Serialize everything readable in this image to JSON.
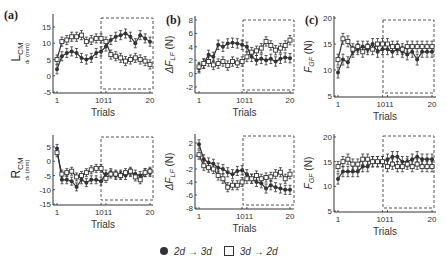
{
  "legend": {
    "filled_label": "2d → 3d",
    "open_label": "3d → 2d"
  },
  "row_labels": {
    "top": "L",
    "top_sub": "CM",
    "bottom": "R",
    "bottom_sub": "CM"
  },
  "panel_labels": {
    "a": "(a)",
    "b": "(b)",
    "c": "(c)"
  },
  "colors": {
    "line": "#333333",
    "dashed_box": "#555555",
    "filled_marker": "#333333",
    "open_marker": "#ffffff"
  },
  "chart_data": [
    {
      "id": "a-top",
      "type": "line",
      "panel": "(a)",
      "row": "LCM",
      "xlabel": "Trials",
      "ylabel": "d_t (mm)",
      "xticks": [
        "1",
        "10",
        "11",
        "20"
      ],
      "yticks": [
        15,
        10,
        5,
        0,
        -5
      ],
      "ylim": [
        -5,
        17
      ],
      "highlight_box": {
        "x_from": 11,
        "x_to": 20
      },
      "series": [
        {
          "name": "2d → 3d",
          "marker": "filled-circle",
          "values": [
            2,
            6,
            7,
            7.5,
            7,
            5.5,
            5,
            5.5,
            7,
            7.5,
            9,
            11,
            12,
            12.5,
            13,
            12,
            10,
            12.5,
            11.5,
            10.5
          ]
        },
        {
          "name": "3d → 2d",
          "marker": "open-square",
          "values": [
            5,
            10.5,
            11,
            12,
            12,
            12.5,
            10.5,
            11,
            11.5,
            11.5,
            10.5,
            6.5,
            6,
            5.5,
            4.5,
            5,
            5.5,
            5,
            4.5,
            3.5
          ]
        }
      ]
    },
    {
      "id": "b-top",
      "type": "line",
      "panel": "(b)",
      "row": "LCM",
      "xlabel": "Trials",
      "ylabel": "ΔF_LF (N)",
      "xticks": [
        "1",
        "10",
        "11",
        "20"
      ],
      "yticks": [
        8,
        6,
        4,
        2,
        0,
        -2
      ],
      "ylim": [
        -2.5,
        8
      ],
      "highlight_box": {
        "x_from": 11,
        "x_to": 20
      },
      "series": [
        {
          "name": "2d → 3d",
          "marker": "filled-circle",
          "values": [
            0.8,
            1.5,
            2.8,
            2.5,
            4.3,
            4.0,
            4.5,
            4.6,
            4.5,
            4.3,
            4.0,
            2.5,
            2.0,
            2.2,
            2.0,
            2.2,
            1.8,
            2.2,
            2.4,
            2.3
          ]
        },
        {
          "name": "3d → 2d",
          "marker": "open-square",
          "values": [
            1.0,
            1.5,
            1.8,
            1.3,
            1.5,
            1.8,
            1.2,
            1.8,
            1.6,
            1.8,
            2.5,
            3.2,
            3.4,
            3.8,
            4.8,
            4.2,
            3.5,
            3.8,
            4.2,
            5.0
          ]
        }
      ]
    },
    {
      "id": "c-top",
      "type": "line",
      "panel": "(c)",
      "row": "LCM",
      "xlabel": "Trials",
      "ylabel": "F_GF (N)",
      "xticks": [
        "1",
        "10",
        "11",
        "20"
      ],
      "yticks": [
        20,
        15,
        10,
        5
      ],
      "ylim": [
        5,
        20
      ],
      "highlight_box": {
        "x_from": 11,
        "x_to": 20
      },
      "series": [
        {
          "name": "2d → 3d",
          "marker": "filled-circle",
          "values": [
            9.5,
            12,
            11.5,
            13.5,
            14,
            14.5,
            14,
            15,
            13.5,
            14,
            14,
            13.5,
            14,
            13.5,
            13,
            13.5,
            12,
            13.5,
            13.5,
            13.5
          ]
        },
        {
          "name": "3d → 2d",
          "marker": "open-square",
          "values": [
            12,
            16,
            15.5,
            14,
            14.5,
            13.5,
            14.5,
            14,
            15,
            15,
            15,
            14.5,
            14.5,
            14,
            14.5,
            14.5,
            14.5,
            14.5,
            14.5,
            14.5
          ]
        }
      ]
    },
    {
      "id": "a-bottom",
      "type": "line",
      "panel": "(a)",
      "row": "RCM",
      "xlabel": "Trials",
      "ylabel": "d_t (mm)",
      "xticks": [
        "1",
        "10",
        "11",
        "20"
      ],
      "yticks": [
        5,
        0,
        -5,
        -10,
        -15
      ],
      "ylim": [
        -15,
        7
      ],
      "highlight_box": {
        "x_from": 11,
        "x_to": 20
      },
      "series": [
        {
          "name": "2d → 3d",
          "marker": "filled-circle",
          "values": [
            4.5,
            -6.5,
            -6.5,
            -7,
            -9,
            -6.5,
            -7.5,
            -6.5,
            -6.5,
            -7,
            -4.5,
            -4,
            -5,
            -4.5,
            -5,
            -4,
            -4.5,
            -5,
            -4,
            -4
          ]
        },
        {
          "name": "3d → 2d",
          "marker": "open-square",
          "values": [
            3,
            -4.5,
            -4,
            -3.5,
            -5.5,
            -5,
            -4,
            -3,
            -2.5,
            -2.5,
            -6,
            -4.5,
            -4.5,
            -5,
            -4,
            -3.5,
            -5.5,
            -6.5,
            -4,
            -3.5
          ]
        }
      ]
    },
    {
      "id": "b-bottom",
      "type": "line",
      "panel": "(b)",
      "row": "RCM",
      "xlabel": "Trials",
      "ylabel": "ΔF_LF (N)",
      "xticks": [
        "1",
        "10",
        "11",
        "20"
      ],
      "yticks": [
        2,
        0,
        -2,
        -4,
        -6,
        -8
      ],
      "ylim": [
        -8,
        2.5
      ],
      "highlight_box": {
        "x_from": 11,
        "x_to": 20
      },
      "series": [
        {
          "name": "2d → 3d",
          "marker": "filled-circle",
          "values": [
            1.8,
            -0.5,
            -1.0,
            -1.2,
            -1.8,
            -2.0,
            -2.5,
            -2.8,
            -2.3,
            -2.2,
            -2.8,
            -3.5,
            -4.0,
            -4.2,
            -5.0,
            -4.5,
            -4.8,
            -5.0,
            -5.2,
            -5.2
          ]
        },
        {
          "name": "3d → 2d",
          "marker": "open-square",
          "values": [
            0.2,
            -1.5,
            -1.8,
            -2.0,
            -3.0,
            -3.5,
            -4.8,
            -4.5,
            -4.5,
            -4.0,
            -3.5,
            -3.5,
            -3.0,
            -3.5,
            -3.3,
            -3.2,
            -2.8,
            -2.5,
            -3.5,
            -2.8
          ]
        }
      ]
    },
    {
      "id": "c-bottom",
      "type": "line",
      "panel": "(c)",
      "row": "RCM",
      "xlabel": "Trials",
      "ylabel": "F_GF (N)",
      "xticks": [
        "1",
        "10",
        "11",
        "20"
      ],
      "yticks": [
        20,
        15,
        10,
        5
      ],
      "ylim": [
        5,
        20
      ],
      "highlight_box": {
        "x_from": 11,
        "x_to": 20
      },
      "series": [
        {
          "name": "2d → 3d",
          "marker": "filled-circle",
          "values": [
            11.5,
            13,
            13,
            13,
            13,
            14,
            14,
            15,
            15,
            15,
            15.5,
            16,
            16,
            15,
            15,
            15.5,
            16,
            15.5,
            15.5,
            15.5
          ]
        },
        {
          "name": "3d → 2d",
          "marker": "open-square",
          "values": [
            14,
            15,
            15.5,
            14.5,
            14.5,
            15.5,
            15.5,
            15,
            15,
            15,
            14,
            14.5,
            14,
            14,
            14.5,
            14,
            14.5,
            14,
            14,
            14
          ]
        }
      ]
    }
  ]
}
